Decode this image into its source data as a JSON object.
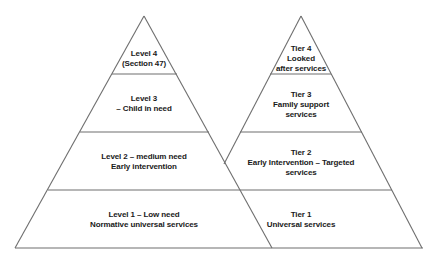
{
  "line_color": "#6e6e6e",
  "left_pyramid": {
    "title": "Levels of need",
    "tiers": [
      {
        "lines": [
          "Level 4",
          "(Section 47)"
        ]
      },
      {
        "lines": [
          "Level  3",
          "– Child in need"
        ]
      },
      {
        "lines": [
          "Level 2 – medium need",
          "Early intervention"
        ]
      },
      {
        "lines": [
          "Level 1 – Low need",
          "Normative universal services"
        ]
      }
    ]
  },
  "right_pyramid": {
    "title": "Tiers of services",
    "tiers": [
      {
        "lines": [
          "Tier 4",
          "Looked",
          "after services"
        ]
      },
      {
        "lines": [
          "Tier 3",
          "Family support",
          "services"
        ]
      },
      {
        "lines": [
          "Tier 2",
          "Early Intervention – Targeted",
          "services"
        ]
      },
      {
        "lines": [
          "Tier 1",
          "Universal services"
        ]
      }
    ]
  }
}
